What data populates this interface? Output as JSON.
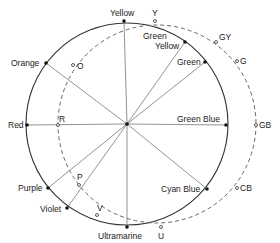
{
  "diagram": {
    "title": "",
    "center": {
      "x": 127,
      "y": 124
    },
    "solid_circle": {
      "cx": 127,
      "cy": 124,
      "r": 101
    },
    "dashed_circle": {
      "cx": 157,
      "cy": 124,
      "r": 99
    },
    "solid_points": [
      {
        "label": "Yellow",
        "x": 124,
        "y": 21
      },
      {
        "label": "Green Yellow",
        "x": 185,
        "y": 42
      },
      {
        "label": "Green",
        "x": 205,
        "y": 62
      },
      {
        "label": "Green Blue",
        "x": 226,
        "y": 125
      },
      {
        "label": "Cyan Blue",
        "x": 207,
        "y": 189
      },
      {
        "label": "Ultramarine",
        "x": 127,
        "y": 227
      },
      {
        "label": "Violet",
        "x": 67,
        "y": 208
      },
      {
        "label": "Purple",
        "x": 48,
        "y": 188
      },
      {
        "label": "Red",
        "x": 27,
        "y": 125
      },
      {
        "label": "Orange",
        "x": 46,
        "y": 63
      }
    ],
    "dashed_points": [
      {
        "label": "Y",
        "x": 155,
        "y": 21
      },
      {
        "label": "GY",
        "x": 216,
        "y": 42
      },
      {
        "label": "G",
        "x": 237,
        "y": 61
      },
      {
        "label": "GB",
        "x": 256,
        "y": 125
      },
      {
        "label": "CB",
        "x": 237,
        "y": 188
      },
      {
        "label": "U",
        "x": 161,
        "y": 227
      },
      {
        "label": "V",
        "x": 97,
        "y": 215
      },
      {
        "label": "P",
        "x": 79,
        "y": 185
      },
      {
        "label": "R",
        "x": 58,
        "y": 125
      },
      {
        "label": "O",
        "x": 73,
        "y": 65
      }
    ],
    "labels": {
      "yellow": "Yellow",
      "green_yellow_1": "Green",
      "green_yellow_2": "Yellow",
      "green": "Green",
      "green_blue": "Green Blue",
      "cyan_blue": "Cyan Blue",
      "ultramarine": "Ultramarine",
      "violet": "Violet",
      "purple": "Purple",
      "red": "Red",
      "orange": "Orange",
      "y": "Y",
      "gy": "GY",
      "g": "G",
      "gb": "GB",
      "cb": "CB",
      "u": "U",
      "v": "V",
      "p": "P",
      "r": "R",
      "o": "O"
    }
  }
}
